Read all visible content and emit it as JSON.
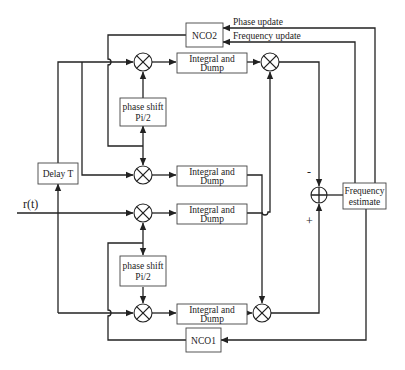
{
  "diagram": {
    "input_signal": "r(t)",
    "blocks": {
      "nco2": "NCO2",
      "nco1": "NCO1",
      "delay": "Delay T",
      "phase_shift_top": [
        "phase shift",
        "Pi/2"
      ],
      "phase_shift_bottom": [
        "phase shift",
        "Pi/2"
      ],
      "integrate_dump_1": [
        "Integral and",
        "Dump"
      ],
      "integrate_dump_2": [
        "Integral and",
        "Dump"
      ],
      "integrate_dump_3": [
        "Integral and",
        "Dump"
      ],
      "integrate_dump_4": [
        "Integral and",
        "Dump"
      ],
      "frequency_estimate": [
        "Frequency",
        "estimate"
      ]
    },
    "feedback_labels": {
      "phase_update": "Phase update",
      "frequency_update": "Frequency update"
    },
    "summer_signs": {
      "minus": "-",
      "plus": "+"
    },
    "colors": {
      "line": "#222222",
      "box_border": "#444444",
      "background": "#ffffff"
    }
  }
}
